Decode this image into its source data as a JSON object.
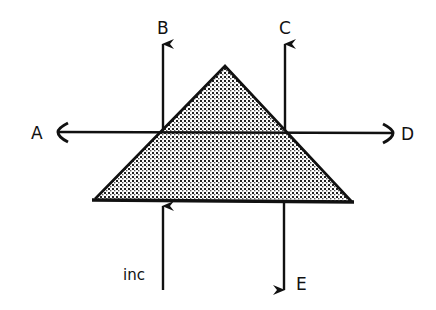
{
  "diagram": {
    "type": "prism-ray-diagram",
    "shape": "triangular-prism",
    "fill_pattern": "stipple-dots",
    "colors": {
      "line": "#111111",
      "fill_dots": "#222222",
      "background": "#ffffff"
    },
    "labels": {
      "A": "A",
      "B": "B",
      "C": "C",
      "D": "D",
      "E": "E",
      "incident": "inc"
    },
    "rays": [
      {
        "id": "inc",
        "direction": "up",
        "role": "incident beam entering base"
      },
      {
        "id": "A",
        "direction": "left",
        "role": "exit ray, wavefront-style arrowhead"
      },
      {
        "id": "B",
        "direction": "up",
        "role": "exit ray"
      },
      {
        "id": "C",
        "direction": "up",
        "role": "exit ray"
      },
      {
        "id": "D",
        "direction": "right",
        "role": "exit ray, wavefront-style arrowhead"
      },
      {
        "id": "E",
        "direction": "down",
        "role": "exit ray through base"
      }
    ]
  }
}
